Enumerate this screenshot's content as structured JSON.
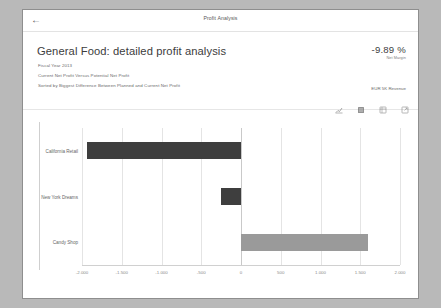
{
  "window": {
    "top_title": "Profit Analysis",
    "back_icon": "arrow-left-icon"
  },
  "header": {
    "title": "General Food: detailed profit analysis",
    "subtitle_1": "Fiscal Year 2013",
    "subtitle_2": "Current Net Profit Versus Potential Net Profit",
    "subtitle_3": "Sorted by Biggest Difference Between Planned and Current Net Profit",
    "kpi_value": "-9.89 %",
    "kpi_label": "Net Margin",
    "kpi_revenue": "EUR 5K Revenue"
  },
  "toolbar": {
    "items": [
      {
        "name": "sort-icon",
        "label": "Sort"
      },
      {
        "name": "filter-icon",
        "label": "Filter"
      },
      {
        "name": "table-view-icon",
        "label": "Table View"
      },
      {
        "name": "fullscreen-icon",
        "label": "Full Screen"
      }
    ]
  },
  "colors": {
    "bar_negative": "#3e3e3e",
    "bar_positive": "#9a9a9a",
    "grid": "#e4e4e4",
    "zero_line": "#c9c9c9",
    "text": "#666666"
  },
  "chart_data": {
    "type": "bar",
    "orientation": "horizontal",
    "title": "General Food: detailed profit analysis",
    "xlabel": "",
    "ylabel": "",
    "xlim": [
      -2000,
      2000
    ],
    "grid": true,
    "legend": "none",
    "categories": [
      "California Retail",
      "New York Dreams",
      "Candy Shop"
    ],
    "values": [
      -1940,
      -250,
      1600
    ],
    "tick_labels": [
      "-2.000",
      "-1.500",
      "-1.000",
      "-500",
      "0",
      "500",
      "1.000",
      "1.500",
      "2.000"
    ],
    "tick_values": [
      -2000,
      -1500,
      -1000,
      -500,
      0,
      500,
      1000,
      1500,
      2000
    ]
  }
}
